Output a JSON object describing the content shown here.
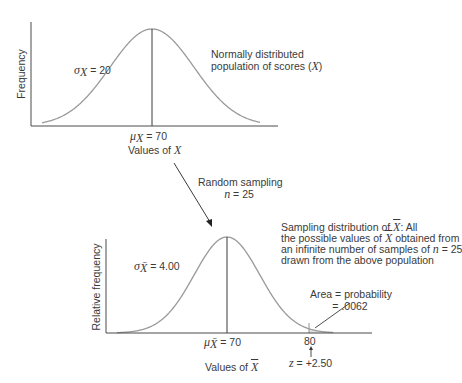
{
  "colors": {
    "axis": "#4a4a4a",
    "curve": "#9a9a9a",
    "mean_line": "#3a3a3a",
    "shade": "#e2e2e2",
    "text": "#3a3a3a"
  },
  "top_panel": {
    "y_axis_label": "Frequency",
    "sigma_symbol": "σ",
    "sigma_sub": "X",
    "sigma_value": "= 20",
    "mu_symbol": "μ",
    "mu_sub": "X",
    "mu_value": "= 70",
    "x_axis_label_prefix": "Values of ",
    "x_axis_label_var": "X",
    "description_line1": "Normally distributed",
    "description_line2_prefix": "population of scores (",
    "description_line2_var": "X",
    "description_line2_suffix": ")"
  },
  "transition": {
    "label_line1": "Random sampling",
    "label_n": "n",
    "label_n_value": "= 25"
  },
  "bottom_panel": {
    "y_axis_label": "Relative frequency",
    "sigma_symbol": "σ",
    "sigma_sub": "X̄",
    "sigma_value": "= 4.00",
    "mu_symbol": "μ",
    "mu_sub": "X̄",
    "mu_value": "= 70",
    "x_axis_label_prefix": "Values of ",
    "x_axis_label_var": "X",
    "tick_80": "80",
    "z_label": "z",
    "z_value": "= +2.50",
    "area_line1": "Area = probability",
    "area_line2": "= .0062",
    "description_line1_prefix": "Sampling distribution of ",
    "description_line1_var": "X",
    "description_line1_suffix": ": All",
    "description_line2_prefix": "the possible values of ",
    "description_line2_var": "X",
    "description_line2_suffix": " obtained from",
    "description_line3_prefix": "an infinite number of samples of ",
    "description_line3_var": "n",
    "description_line3_suffix": " = 25",
    "description_line4": "drawn from the above population"
  },
  "chart_data": [
    {
      "type": "area",
      "title": "Normally distributed population of scores (X)",
      "xlabel": "Values of X",
      "ylabel": "Frequency",
      "distribution": "normal",
      "mean": 70,
      "sd": 20,
      "annotations": [
        "σX = 20",
        "μX = 70"
      ]
    },
    {
      "type": "area",
      "title": "Sampling distribution of X̄",
      "xlabel": "Values of X̄",
      "ylabel": "Relative frequency",
      "distribution": "normal",
      "mean": 70,
      "sd": 4.0,
      "sample_size": 25,
      "shaded_region": {
        "from": 80,
        "to": "inf",
        "z": 2.5,
        "probability": 0.0062
      },
      "annotations": [
        "σX̄ = 4.00",
        "μX̄ = 70",
        "80",
        "z = +2.50",
        "Area = probability = .0062"
      ]
    }
  ]
}
